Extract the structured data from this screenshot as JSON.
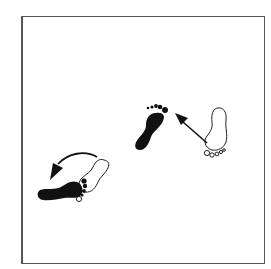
{
  "diagram": {
    "type": "footwork-step-diagram",
    "frame_color": "#555555",
    "ink_color": "#111111",
    "elements": [
      {
        "id": "foot-1",
        "label": "outline right foot (start)",
        "fill": "none",
        "position": "right"
      },
      {
        "id": "arrow-1",
        "label": "straight arrow pointing up-left",
        "position": "center-right"
      },
      {
        "id": "foot-2",
        "label": "solid foot (step destination)",
        "fill": "black",
        "position": "center"
      },
      {
        "id": "foot-3",
        "label": "outline foot (start, pivot)",
        "fill": "none",
        "position": "lower-left"
      },
      {
        "id": "arrow-2",
        "label": "curved arrow turning counter-clockwise",
        "position": "lower-left"
      },
      {
        "id": "foot-4",
        "label": "solid foot rotated (pivot destination)",
        "fill": "black",
        "position": "lower-left"
      }
    ]
  }
}
